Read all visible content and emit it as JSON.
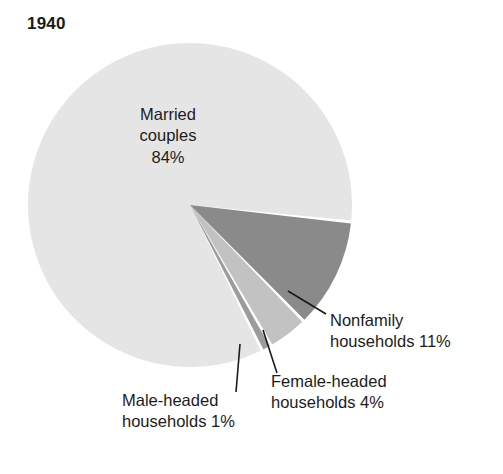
{
  "chart_data": {
    "type": "pie",
    "title": "1940",
    "subtitle": "",
    "xlabel": "",
    "ylabel": "",
    "legend_position": "none",
    "grid": false,
    "unit": "%",
    "categories": [
      "Married couples",
      "Nonfamily households",
      "Female-headed households",
      "Male-headed households"
    ],
    "values": [
      84,
      11,
      4,
      1
    ],
    "slices": [
      {
        "name": "Married couples",
        "value": 84,
        "value_label": "84%",
        "color": "#e5e5e5",
        "label_lines": [
          "Married",
          "couples",
          "84%"
        ],
        "label_placement": "inside",
        "leader_line": false
      },
      {
        "name": "Nonfamily households",
        "value": 11,
        "value_label": "11%",
        "color": "#8a8a8a",
        "label_lines": [
          "Nonfamily",
          "households 11%"
        ],
        "label_placement": "outside-right",
        "leader_line": true
      },
      {
        "name": "Female-headed households",
        "value": 4,
        "value_label": "4%",
        "color": "#c2c2c2",
        "label_lines": [
          "Female-headed",
          "households 4%"
        ],
        "label_placement": "outside-bottom-right",
        "leader_line": true
      },
      {
        "name": "Male-headed households",
        "value": 1,
        "value_label": "1%",
        "color": "#9c9c9c",
        "label_lines": [
          "Male-headed",
          "households 1%"
        ],
        "label_placement": "outside-bottom-left",
        "leader_line": true
      }
    ]
  },
  "chart": {
    "title": "1940"
  },
  "labels": {
    "married": {
      "line1": "Married",
      "line2": "couples",
      "line3": "84%"
    },
    "nonfamily": {
      "line1": "Nonfamily",
      "line2": "households 11%"
    },
    "female": {
      "line1": "Female-headed",
      "line2": "households 4%"
    },
    "male": {
      "line1": "Male-headed",
      "line2": "households 1%"
    }
  },
  "colors": {
    "married": "#e5e5e5",
    "nonfamily": "#8a8a8a",
    "female": "#c2c2c2",
    "male": "#9c9c9c",
    "background": "#ffffff",
    "text": "#1c1c1c",
    "leader_line": "#1a1a1a"
  }
}
